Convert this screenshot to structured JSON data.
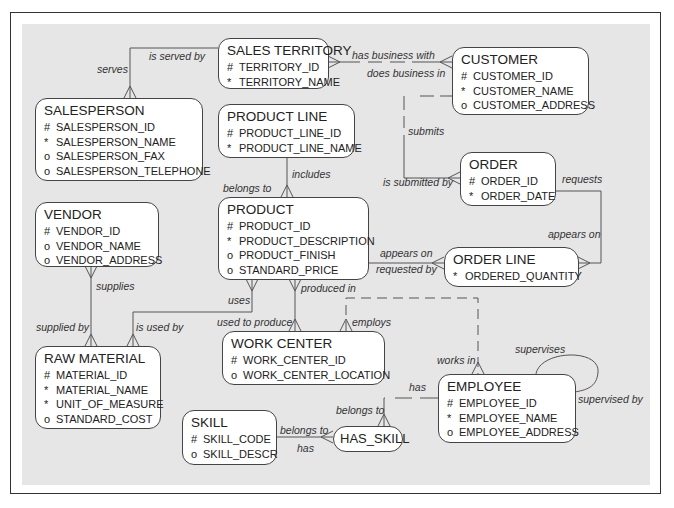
{
  "diagram": {
    "type": "entity-relationship",
    "entities": [
      {
        "id": "sales_territory",
        "name": "SALES TERRITORY",
        "attributes": [
          {
            "mark": "#",
            "name": "TERRITORY_ID"
          },
          {
            "mark": "*",
            "name": "TERRITORY_NAME"
          }
        ]
      },
      {
        "id": "customer",
        "name": "CUSTOMER",
        "attributes": [
          {
            "mark": "#",
            "name": "CUSTOMER_ID"
          },
          {
            "mark": "*",
            "name": "CUSTOMER_NAME"
          },
          {
            "mark": "o",
            "name": "CUSTOMER_ADDRESS"
          }
        ]
      },
      {
        "id": "salesperson",
        "name": "SALESPERSON",
        "attributes": [
          {
            "mark": "#",
            "name": "SALESPERSON_ID"
          },
          {
            "mark": "*",
            "name": "SALESPERSON_NAME"
          },
          {
            "mark": "o",
            "name": "SALESPERSON_FAX"
          },
          {
            "mark": "o",
            "name": "SALESPERSON_TELEPHONE"
          }
        ]
      },
      {
        "id": "product_line",
        "name": "PRODUCT LINE",
        "attributes": [
          {
            "mark": "#",
            "name": "PRODUCT_LINE_ID"
          },
          {
            "mark": "*",
            "name": "PRODUCT_LINE_NAME"
          }
        ]
      },
      {
        "id": "order",
        "name": "ORDER",
        "attributes": [
          {
            "mark": "#",
            "name": "ORDER_ID"
          },
          {
            "mark": "*",
            "name": "ORDER_DATE"
          }
        ]
      },
      {
        "id": "vendor",
        "name": "VENDOR",
        "attributes": [
          {
            "mark": "#",
            "name": "VENDOR_ID"
          },
          {
            "mark": "o",
            "name": "VENDOR_NAME"
          },
          {
            "mark": "o",
            "name": "VENDOR_ADDRESS"
          }
        ]
      },
      {
        "id": "product",
        "name": "PRODUCT",
        "attributes": [
          {
            "mark": "#",
            "name": "PRODUCT_ID"
          },
          {
            "mark": "*",
            "name": "PRODUCT_DESCRIPTION"
          },
          {
            "mark": "o",
            "name": "PRODUCT_FINISH"
          },
          {
            "mark": "o",
            "name": "STANDARD_PRICE"
          }
        ]
      },
      {
        "id": "order_line",
        "name": "ORDER LINE",
        "attributes": [
          {
            "mark": "*",
            "name": "ORDERED_QUANTITY"
          }
        ]
      },
      {
        "id": "work_center",
        "name": "WORK CENTER",
        "attributes": [
          {
            "mark": "#",
            "name": "WORK_CENTER_ID"
          },
          {
            "mark": "o",
            "name": "WORK_CENTER_LOCATION"
          }
        ]
      },
      {
        "id": "raw_material",
        "name": "RAW MATERIAL",
        "attributes": [
          {
            "mark": "#",
            "name": "MATERIAL_ID"
          },
          {
            "mark": "*",
            "name": "MATERIAL_NAME"
          },
          {
            "mark": "*",
            "name": "UNIT_OF_MEASURE"
          },
          {
            "mark": "o",
            "name": "STANDARD_COST"
          }
        ]
      },
      {
        "id": "employee",
        "name": "EMPLOYEE",
        "attributes": [
          {
            "mark": "#",
            "name": "EMPLOYEE_ID"
          },
          {
            "mark": "*",
            "name": "EMPLOYEE_NAME"
          },
          {
            "mark": "o",
            "name": "EMPLOYEE_ADDRESS"
          }
        ]
      },
      {
        "id": "skill",
        "name": "SKILL",
        "attributes": [
          {
            "mark": "#",
            "name": "SKILL_CODE"
          },
          {
            "mark": "o",
            "name": "SKILL_DESCR"
          }
        ]
      },
      {
        "id": "has_skill",
        "name": "HAS_SKILL",
        "attributes": []
      }
    ],
    "relationship_labels": {
      "serves": "serves",
      "is_served_by": "is served by",
      "has_business_with": "has business with",
      "does_business_in": "does business in",
      "submits": "submits",
      "is_submitted_by": "is submitted by",
      "requests": "requests",
      "appears_on_right": "appears on",
      "appears_on_left": "appears on",
      "requested_by": "requested by",
      "includes": "includes",
      "belongs_to_product": "belongs to",
      "supplies": "supplies",
      "supplied_by": "supplied by",
      "uses": "uses",
      "is_used_by": "is used by",
      "produced_in": "produced in",
      "used_to_produce": "used to produce",
      "employs": "employs",
      "works_in": "works in",
      "supervises": "supervises",
      "supervised_by": "supervised by",
      "has_employee": "has",
      "belongs_to_employee": "belongs to",
      "belongs_to_skill": "belongs to",
      "has_skill_rel": "has"
    },
    "colors": {
      "panel_background": "#e6e6e6",
      "entity_background": "#ffffff",
      "line_color": "#555555",
      "frame_border": "#333333"
    }
  }
}
